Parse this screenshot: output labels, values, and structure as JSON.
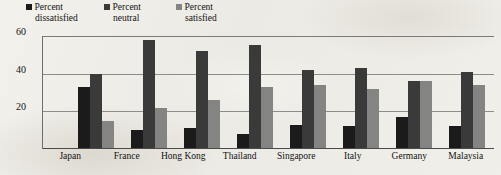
{
  "legend": {
    "items": [
      {
        "name": "dissatisfied",
        "line1": "Percent",
        "line2": "dissatisfied",
        "color": "#1b1b1b"
      },
      {
        "name": "neutral",
        "line1": "Percent",
        "line2": "neutral",
        "color": "#3b3a3a"
      },
      {
        "name": "satisfied",
        "line1": "Percent",
        "line2": "satisfied",
        "color": "#848483"
      }
    ]
  },
  "axis": {
    "yticks": [
      "60",
      "40",
      "20"
    ]
  },
  "caption": {
    "text": ""
  },
  "chart_data": {
    "type": "bar",
    "title": "",
    "subtitle": "",
    "xlabel": "",
    "ylabel": "",
    "ylim": [
      0,
      60
    ],
    "yticks": [
      20,
      40,
      60
    ],
    "grid": true,
    "legend_position": "top-left",
    "categories": [
      "Japan",
      "France",
      "Hong Kong",
      "Thailand",
      "Singapore",
      "Italy",
      "Germany",
      "Malaysia"
    ],
    "series": [
      {
        "name": "Percent dissatisfied",
        "color": "#1b1b1b",
        "values": [
          33,
          10,
          11,
          8,
          13,
          12,
          17,
          12
        ]
      },
      {
        "name": "Percent neutral",
        "color": "#3b3a3a",
        "values": [
          40,
          58,
          52,
          55,
          42,
          43,
          36,
          41
        ]
      },
      {
        "name": "Percent satisfied",
        "color": "#848483",
        "values": [
          15,
          22,
          26,
          33,
          34,
          32,
          36,
          34
        ]
      }
    ]
  }
}
